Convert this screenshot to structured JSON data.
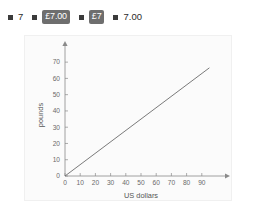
{
  "options": [
    {
      "label": "7",
      "highlighted": false
    },
    {
      "label": "£7.00",
      "highlighted": true
    },
    {
      "label": "£7",
      "highlighted": true
    },
    {
      "label": "7.00",
      "highlighted": false
    }
  ],
  "colors": {
    "badge_background": "#6e6e6e",
    "badge_text": "#ffffff",
    "bullet": "#3b3b3b",
    "axis": "#8a8a8a",
    "line": "#6b6b6b",
    "panel_background": "#fbfbfb",
    "page_background": "#ffffff"
  },
  "chart_data": {
    "type": "line",
    "title": "",
    "xlabel": "US dollars",
    "ylabel": "pounds",
    "xlim": [
      0,
      100
    ],
    "ylim": [
      0,
      75
    ],
    "xticks": [
      0,
      10,
      20,
      30,
      40,
      50,
      60,
      70,
      80,
      90
    ],
    "yticks": [
      0,
      10,
      20,
      30,
      40,
      50,
      60,
      70
    ],
    "grid": false,
    "legend": null,
    "series": [
      {
        "name": "dollars to pounds conversion",
        "x": [
          0,
          95
        ],
        "y": [
          0,
          66.5
        ]
      }
    ],
    "slope": 0.7,
    "intercept": 0
  }
}
